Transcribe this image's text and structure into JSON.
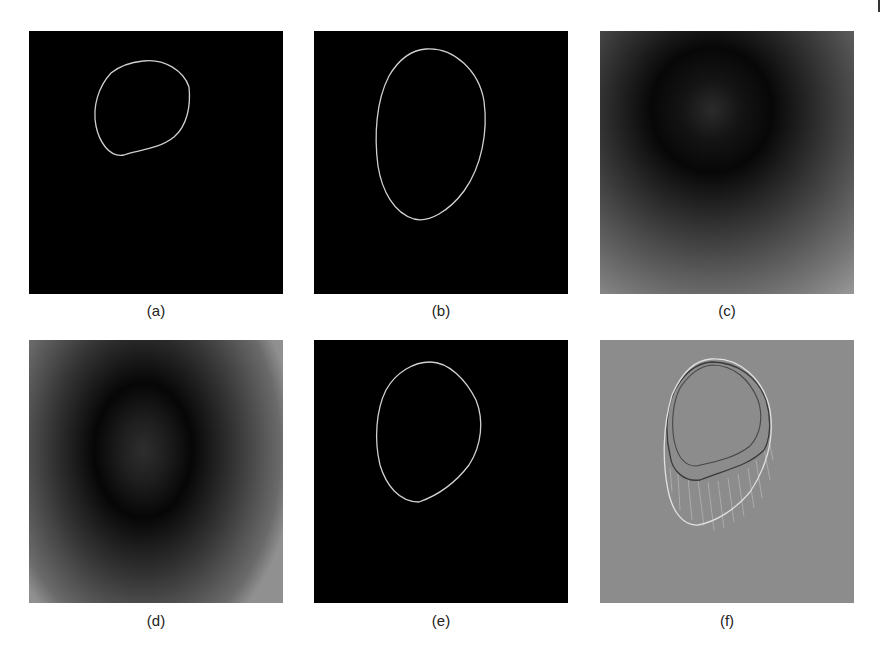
{
  "figure": {
    "panels": [
      {
        "id": "a",
        "label": "(a)",
        "content": "binary contour on black, small rounded shape"
      },
      {
        "id": "b",
        "label": "(b)",
        "content": "binary contour on black, larger egg shape"
      },
      {
        "id": "c",
        "label": "(c)",
        "content": "grayscale distance/energy map, dark ring"
      },
      {
        "id": "d",
        "label": "(d)",
        "content": "grayscale distance/energy map, elongated dark ring"
      },
      {
        "id": "e",
        "label": "(e)",
        "content": "binary contour on black, egg shape"
      },
      {
        "id": "f",
        "label": "(f)",
        "content": "gray background with overlaid contours and correspondence lines"
      }
    ],
    "colors": {
      "black": "#000000",
      "gray_bg": "#8a8a8a",
      "contour": "#d8d8d8",
      "dark_contour": "#333333"
    }
  }
}
